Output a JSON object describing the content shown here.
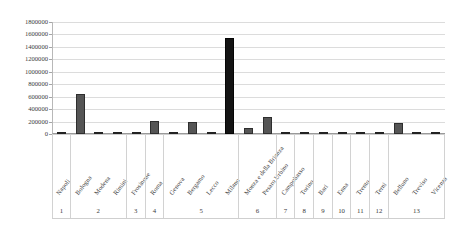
{
  "chart_data": {
    "type": "bar",
    "title": "",
    "xlabel": "",
    "ylabel": "",
    "ylim": [
      0,
      1800000
    ],
    "ytick_step": 200000,
    "grid": true,
    "legend": "none",
    "bar_color": "#555555",
    "bar_border_color": "#2e2e2e",
    "gridline_color": "#dcdcdc",
    "axis_color": "#9a9a9a",
    "yticks": [
      "1800000",
      "1600000",
      "1400000",
      "1200000",
      "1000000",
      "800000",
      "600000",
      "400000",
      "200000",
      "0"
    ],
    "categories": [
      "Napoli",
      "Bologna",
      "Modena",
      "Rimini",
      "Frosinone",
      "Roma",
      "Genova",
      "Bergamo",
      "Lecco",
      "Milano",
      "Monza e della Brianza",
      "Pesaro Urbino",
      "Campobasso",
      "Torino",
      "Bari",
      "Enna",
      "Trento",
      "Terni",
      "Belluno",
      "Treviso",
      "Vicenza"
    ],
    "values": [
      30000,
      650000,
      20000,
      20000,
      18000,
      215000,
      30000,
      200000,
      40000,
      1550000,
      95000,
      280000,
      25000,
      40000,
      38000,
      25000,
      30000,
      35000,
      185000,
      30000,
      28000
    ],
    "group_labels": [
      "1",
      "2",
      "3",
      "4",
      "5",
      "6",
      "7",
      "8",
      "9",
      "10",
      "11",
      "12",
      "13"
    ],
    "group_sizes": [
      1,
      3,
      1,
      1,
      4,
      2,
      1,
      1,
      1,
      1,
      1,
      1,
      3
    ]
  }
}
